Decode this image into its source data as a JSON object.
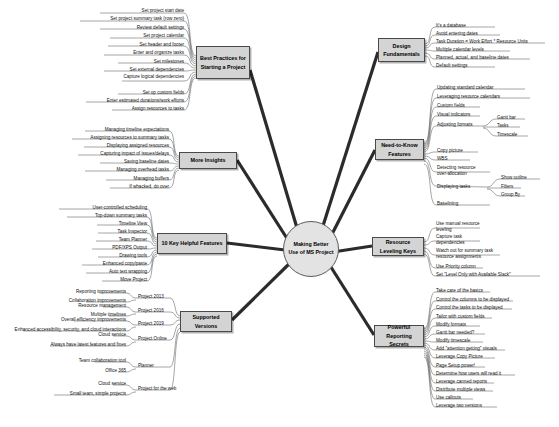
{
  "center": {
    "title": "Making Better Use of MS Project"
  },
  "colors": {
    "node_fill": "#d4d4d4",
    "center_fill": "#e3e3e3",
    "stroke": "#4a4a4a",
    "text": "#111111",
    "background": "#ffffff"
  },
  "branches": [
    {
      "id": "best-practices",
      "label": "Best Practices for Starting a Project",
      "side": "left",
      "leaves": [
        "Set project start date",
        "Set project summary task (row zero)",
        "Review default settings",
        "Set project calendar",
        "Set header and footer",
        "Enter and organize tasks",
        "Set milestones",
        "Set external dependencies",
        "Capture logical dependencies",
        "Set up custom fields",
        "Enter estimated durations/work efforts",
        "Assign resources to tasks"
      ]
    },
    {
      "id": "more-insights",
      "label": "More Insights",
      "side": "left",
      "leaves": [
        "Managing timeline expectations",
        "Assigning resources to summary tasks",
        "Displaying assigned resources",
        "Capturing impact of issues/delays",
        "Saving baseline dates",
        "Managing overhead tasks",
        "Managing buffers",
        "If whacked, do over"
      ]
    },
    {
      "id": "key-helpful-features",
      "label": "10 Key Helpful Features",
      "side": "left",
      "leaves": [
        "User-controlled scheduling",
        "Top-down summary tasks",
        "Timeline View",
        "Task Inspector",
        "Team Planner",
        "PDF/XPS Output",
        "Drawing tools",
        "Enhanced copy/paste",
        "Auto text wrapping",
        "Move Project"
      ]
    },
    {
      "id": "supported-versions",
      "label": "Supported Versions",
      "side": "left",
      "groups": [
        {
          "name": "Project 2013",
          "items": [
            "Reporting improvements",
            "Collaboration improvements"
          ]
        },
        {
          "name": "Project 2016",
          "items": [
            "Resource management",
            "Multiple timelines"
          ]
        },
        {
          "name": "Project 2019",
          "items": [
            "Overall efficiency improvements",
            "Enhanced accessibility, security, and cloud interactions"
          ]
        },
        {
          "name": "Project Online",
          "items": [
            "Cloud service",
            "Always have latest features and fixes"
          ]
        },
        {
          "name": "Planner",
          "items": [
            "Team collaboration tool",
            "Office 365"
          ]
        },
        {
          "name": "Project for the web",
          "items": [
            "Cloud service",
            "Small team, simple projects"
          ]
        }
      ]
    },
    {
      "id": "design-fundamentals",
      "label": "Design Fundamentals",
      "side": "right",
      "leaves": [
        "It's a database",
        "Avoid entering dates",
        "Task Duration = Work Effort * Resource Units",
        "Multiple calendar levels",
        "Planned, actual, and baseline dates",
        "Default settings"
      ]
    },
    {
      "id": "need-to-know-features",
      "label": "Need-to-Know Features",
      "side": "right",
      "leaves": [
        "Updating standard calendar",
        "Leveraging resource calendars",
        "Custom fields",
        "Visual indicators",
        "Adjusting formats",
        "Copy picture",
        "WBS",
        "Detecting resource over-allocation",
        "Displaying tasks",
        "Baselining"
      ],
      "sub_groups": [
        {
          "parent": "Adjusting formats",
          "items": [
            "Gantt bar",
            "Tasks",
            "Timescale"
          ]
        },
        {
          "parent": "Displaying tasks",
          "items": [
            "Show outline",
            "Filters",
            "Group By"
          ]
        }
      ]
    },
    {
      "id": "resource-leveling-keys",
      "label": "Resource Leveling Keys",
      "side": "right",
      "leaves": [
        "Use manual resource leveling",
        "Capture task dependencies",
        "Watch out for summary task resource assignments",
        "Use Priority column",
        "Set \"Level Only with Available Slack\""
      ]
    },
    {
      "id": "powerful-reporting-secrets",
      "label": "Powerful Reporting Secrets",
      "side": "right",
      "leaves": [
        "Take care of the basics",
        "Control the columns to be displayed",
        "Control the tasks to be displayed",
        "Tailor with custom fields",
        "Modify formats",
        "Gantt bar needed?",
        "Modify timescale",
        "Add \"attention getting\" visuals",
        "Leverage Copy Picture",
        "Page Setup power!",
        "Determine how users will read it",
        "Leverage canned reports",
        "Distribute multiple views",
        "Use callouts",
        "Leverage two versions"
      ]
    }
  ]
}
